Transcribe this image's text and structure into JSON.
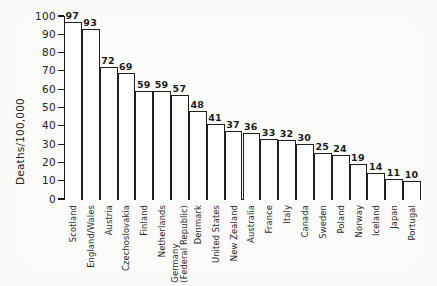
{
  "chart_data": {
    "type": "bar",
    "title": "",
    "xlabel": "",
    "ylabel": "Deaths/100,000",
    "ylim": [
      0,
      100
    ],
    "ytick_step": 10,
    "yticks": [
      "100",
      "90",
      "80",
      "70",
      "60",
      "50",
      "40",
      "30",
      "20",
      "10",
      "0"
    ],
    "grid": false,
    "legend": "none",
    "bar_style": {
      "fill": "#fdfdfb",
      "edge": "#1f1f1f",
      "show_value_labels": true
    },
    "categories": [
      "Scotland",
      "England/Wales",
      "Austria",
      "Czechoslovakia",
      "Finland",
      "Netherlands",
      "Germany (Federal Republic)",
      "Denmark",
      "United States",
      "New Zealand",
      "Australia",
      "France",
      "Italy",
      "Canada",
      "Sweden",
      "Poland",
      "Norway",
      "Iceland",
      "Japan",
      "Portugal"
    ],
    "category_label_lines": [
      [
        "Scotland"
      ],
      [
        "England/Wales"
      ],
      [
        "Austria"
      ],
      [
        "Czechoslovakia"
      ],
      [
        "Finland"
      ],
      [
        "Netherlands"
      ],
      [
        "Germany",
        "(Federal Republic)"
      ],
      [
        "Denmark"
      ],
      [
        "United States"
      ],
      [
        "New Zealand"
      ],
      [
        "Australia"
      ],
      [
        "France"
      ],
      [
        "Italy"
      ],
      [
        "Canada"
      ],
      [
        "Sweden"
      ],
      [
        "Poland"
      ],
      [
        "Norway"
      ],
      [
        "Iceland"
      ],
      [
        "Japan"
      ],
      [
        "Portugal"
      ]
    ],
    "values": [
      97,
      93,
      72,
      69,
      59,
      59,
      57,
      48,
      41,
      37,
      36,
      33,
      32,
      30,
      25,
      24,
      19,
      14,
      11,
      10
    ],
    "value_labels": [
      "97",
      "93",
      "72",
      "69",
      "59",
      "59",
      "57",
      "48",
      "41",
      "37",
      "36",
      "33",
      "32",
      "30",
      "25",
      "24",
      "19",
      "14",
      "11",
      "10"
    ]
  },
  "colors": {
    "background": "#fbfbf9",
    "ink": "#1a1a1a",
    "bar_fill": "#fdfdfb",
    "bar_edge": "#1f1f1f"
  }
}
